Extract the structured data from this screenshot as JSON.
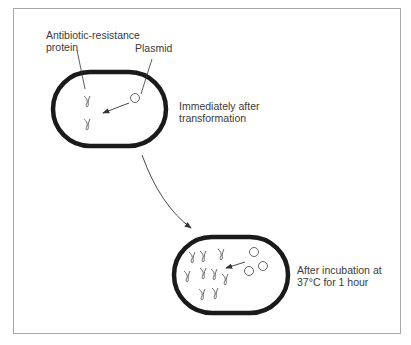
{
  "labels": {
    "protein": [
      "Antibiotic-resistance",
      "protein"
    ],
    "plasmid": "Plasmid",
    "state1": [
      "Immediately after",
      "transformation"
    ],
    "state2": [
      "After incubation at",
      "37°C for 1 hour"
    ]
  },
  "colors": {
    "outline": "#1a1a1a",
    "frame": "#a8a8a8",
    "text": "#3a3a3a",
    "symbol": "#555555"
  },
  "cells": [
    {
      "name": "cell-before",
      "plasmids": 1,
      "proteins": 2
    },
    {
      "name": "cell-after",
      "plasmids": 3,
      "proteins": 11
    }
  ]
}
